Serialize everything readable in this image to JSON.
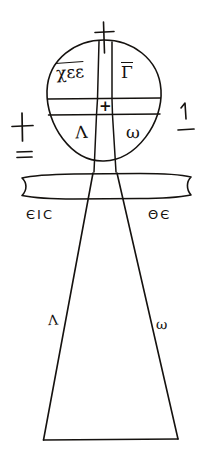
{
  "figure": {
    "ink_color": "#15120f",
    "background_color": "#ffffff",
    "width": 212,
    "height": 460
  },
  "loop": {
    "finial_cross": "+",
    "center_cross": "+",
    "quadrants": [
      {
        "position": "top-left",
        "text": "χεε",
        "overline": true
      },
      {
        "position": "top-right",
        "text": "Γ",
        "overline": true
      },
      {
        "position": "bottom-left",
        "text": "Λ",
        "overline": false
      },
      {
        "position": "bottom-right",
        "text": "ω",
        "overline": false
      }
    ]
  },
  "margins": {
    "left_cross": "+",
    "left_double_stroke": "=",
    "right_numeral": "1",
    "right_stroke": "—"
  },
  "inscriptions": {
    "left": "ЄIC",
    "right": "ΘЄ"
  },
  "shaft": {
    "left_label": "Λ",
    "right_label": "ω"
  }
}
